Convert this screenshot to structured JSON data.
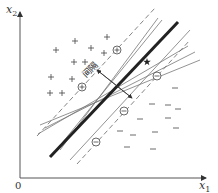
{
  "diagram": {
    "axes": {
      "x_label": "x",
      "x_sub": "1",
      "y_label": "x",
      "y_sub": "2",
      "origin": "0"
    },
    "margin_label": "间隔",
    "colors": {
      "ink": "#333333",
      "thin_line": "#777777",
      "thick_line": "#222222",
      "background": "#ffffff"
    },
    "positive_points": [
      [
        75,
        41
      ],
      [
        56,
        50
      ],
      [
        91,
        48
      ],
      [
        104,
        53
      ],
      [
        107,
        37
      ],
      [
        74,
        62
      ],
      [
        85,
        62
      ],
      [
        51,
        77
      ],
      [
        72,
        79
      ],
      [
        50,
        93
      ],
      [
        62,
        93
      ]
    ],
    "positive_support_vectors": [
      [
        82,
        87
      ],
      [
        117,
        50
      ]
    ],
    "negative_points": [
      [
        175,
        88
      ],
      [
        152,
        104
      ],
      [
        168,
        105
      ],
      [
        178,
        109
      ],
      [
        140,
        119
      ],
      [
        168,
        118
      ],
      [
        120,
        131
      ],
      [
        133,
        135
      ],
      [
        155,
        132
      ],
      [
        176,
        128
      ],
      [
        127,
        147
      ],
      [
        153,
        149
      ]
    ],
    "negative_support_vectors": [
      [
        157,
        76
      ],
      [
        124,
        111
      ],
      [
        96,
        142
      ]
    ],
    "star_point": [
      147,
      62
    ],
    "lines": {
      "optimal": [
        [
          50,
          157
        ],
        [
          178,
          22
        ]
      ],
      "margin_upper": [
        [
          37,
          136
        ],
        [
          155,
          8
        ]
      ],
      "margin_lower": [
        [
          77,
          164
        ],
        [
          190,
          40
        ]
      ],
      "alternatives": [
        [
          [
            60,
            150
          ],
          [
            158,
            18
          ]
        ],
        [
          [
            58,
            148
          ],
          [
            162,
            20
          ]
        ],
        [
          [
            38,
            134
          ],
          [
            188,
            46
          ]
        ],
        [
          [
            45,
            128
          ],
          [
            195,
            52
          ]
        ],
        [
          [
            70,
            160
          ],
          [
            190,
            30
          ]
        ],
        [
          [
            40,
            125
          ],
          [
            200,
            60
          ]
        ]
      ]
    },
    "margin_arrow": [
      [
        97,
        70
      ],
      [
        132,
        98
      ]
    ]
  }
}
